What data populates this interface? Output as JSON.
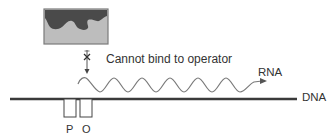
{
  "diagram": {
    "type": "gene-regulation",
    "repressor": {
      "label": "",
      "colors": {
        "fill": "#bdbdbd",
        "blob": "#4a4a4a",
        "border": "#7a7a7a"
      }
    },
    "blocked_arrow": {
      "marker": "x",
      "caption": "Cannot bind to operator"
    },
    "rna": {
      "label": "RNA"
    },
    "dna": {
      "label": "DNA"
    },
    "sites": [
      {
        "id": "promoter",
        "label": "P"
      },
      {
        "id": "operator",
        "label": "O"
      }
    ],
    "colors": {
      "dna_line": "#3a3a3a",
      "rna_wave": "#777777",
      "text": "#333333"
    }
  }
}
